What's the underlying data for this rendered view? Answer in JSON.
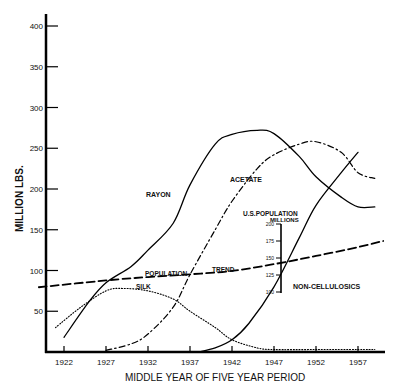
{
  "chart_data": {
    "type": "line",
    "title": "",
    "xlabel": "MIDDLE YEAR OF FIVE YEAR PERIOD",
    "ylabel": "MILLION LBS.",
    "xlim": [
      1919,
      1960
    ],
    "ylim": [
      0,
      400
    ],
    "grid": false,
    "x_ticks": [
      "1922",
      "1927",
      "1932",
      "1937",
      "1942",
      "1947",
      "1952",
      "1957"
    ],
    "y_ticks": [
      "50",
      "100",
      "150",
      "200",
      "250",
      "300",
      "350",
      "400"
    ],
    "series": [
      {
        "name": "RAYON",
        "style": "solid",
        "x": [
          1922,
          1925,
          1927,
          1930,
          1932,
          1935,
          1937,
          1940,
          1942,
          1945,
          1947,
          1950,
          1952,
          1955,
          1957,
          1959
        ],
        "y": [
          18,
          62,
          85,
          105,
          125,
          158,
          205,
          255,
          267,
          272,
          268,
          240,
          215,
          190,
          178,
          178
        ]
      },
      {
        "name": "ACETATE",
        "style": "dash-dot",
        "x": [
          1927,
          1930,
          1932,
          1935,
          1937,
          1940,
          1942,
          1945,
          1947,
          1950,
          1952,
          1955,
          1957,
          1959
        ],
        "y": [
          2,
          10,
          22,
          55,
          95,
          150,
          185,
          225,
          242,
          255,
          258,
          245,
          220,
          213
        ]
      },
      {
        "name": "SILK",
        "style": "dotted",
        "x": [
          1921,
          1924,
          1927,
          1929,
          1932,
          1935,
          1937,
          1940,
          1942,
          1945,
          1947,
          1952,
          1957,
          1959
        ],
        "y": [
          30,
          55,
          75,
          78,
          75,
          65,
          50,
          30,
          15,
          5,
          3,
          3,
          3,
          3
        ]
      },
      {
        "name": "NON-CELLULOSICS",
        "style": "solid",
        "x": [
          1938,
          1940,
          1942,
          1944,
          1947,
          1950,
          1952,
          1955,
          1957
        ],
        "y": [
          0,
          5,
          15,
          35,
          80,
          140,
          180,
          220,
          245
        ]
      },
      {
        "name": "POPULATION TREND",
        "style": "dashed",
        "axis": "secondary (U.S. POPULATION MILLIONS)",
        "x": [
          1919,
          1927,
          1932,
          1937,
          1942,
          1947,
          1952,
          1957,
          1960
        ],
        "y_population_millions": [
          107,
          117,
          122,
          126,
          131,
          141,
          153,
          166,
          175
        ]
      }
    ],
    "secondary_axis": {
      "label": "U.S.POPULATION",
      "sublabel": "MILLIONS",
      "ticks": [
        "100",
        "125",
        "150",
        "175",
        "200"
      ],
      "range": [
        100,
        200
      ]
    },
    "annotations": [
      "RAYON",
      "ACETATE",
      "SILK",
      "POPULATION",
      "TREND",
      "NON-CELLULOSICS",
      "U.S.POPULATION",
      "MILLIONS"
    ]
  },
  "labels": {
    "rayon": "RAYON",
    "acetate": "ACETATE",
    "silk": "SILK",
    "population": "POPULATION",
    "trend": "TREND",
    "noncell": "NON-CELLULOSICS",
    "uspop": "U.S.POPULATION",
    "millions": "MILLIONS",
    "xlabel": "MIDDLE YEAR OF FIVE YEAR PERIOD",
    "ylabel": "MILLION LBS."
  }
}
